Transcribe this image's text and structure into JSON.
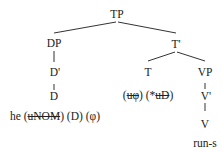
{
  "tree": {
    "root": "TP",
    "nodes": {
      "tp": "TP",
      "dp": "DP",
      "d_bar": "D'",
      "d": "D",
      "t_bar": "T'",
      "t": "T",
      "vp": "VP",
      "v_bar": "V'",
      "v": "V"
    },
    "leaves": {
      "d_word": "he",
      "d_features": [
        {
          "text": "uNOM",
          "struck": true
        },
        {
          "text": "D",
          "struck": false
        },
        {
          "text": "φ",
          "struck": false
        }
      ],
      "t_features": [
        {
          "text": "uφ",
          "struck": true
        },
        {
          "prefix": "*",
          "text": "uD",
          "struck": true
        }
      ],
      "v_word": "run-s"
    }
  }
}
